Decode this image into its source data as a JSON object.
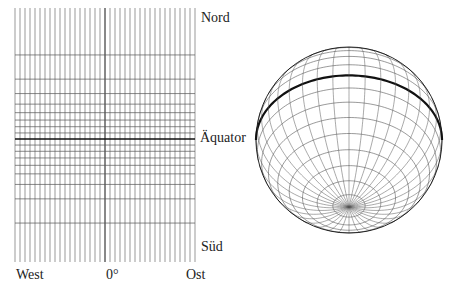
{
  "map": {
    "labels": {
      "north": "Nord",
      "equator": "Äquator",
      "south": "Süd",
      "west": "West",
      "prime_meridian": "0°",
      "east": "Ost"
    },
    "grid": {
      "left": 15,
      "right": 195,
      "top": 8,
      "bottom": 262,
      "equator_y": 139,
      "mercator_scale": 34.5,
      "meridian_step_deg": 10,
      "parallel_step_deg": 10,
      "max_parallel_deg": 80
    }
  },
  "globe": {
    "cx": 349,
    "cy": 140,
    "r": 93,
    "tilt_deg": 44,
    "meridian_step_deg": 10,
    "parallel_step_deg": 10
  },
  "colors": {
    "line": "#555555",
    "bold": "#111111",
    "text": "#222222"
  }
}
